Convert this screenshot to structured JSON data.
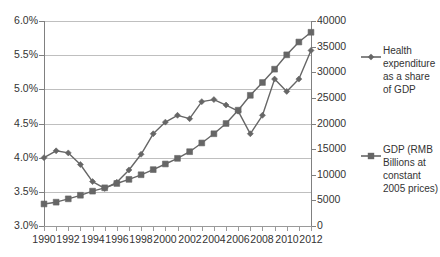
{
  "chart_data": {
    "type": "line",
    "title": "",
    "subtitle": "",
    "xlabel": "",
    "ylabel": "",
    "grid": true,
    "legend_position": "right",
    "x": [
      1990,
      1991,
      1992,
      1993,
      1994,
      1995,
      1996,
      1997,
      1998,
      1999,
      2000,
      2001,
      2002,
      2003,
      2004,
      2005,
      2006,
      2007,
      2008,
      2009,
      2010,
      2011,
      2012
    ],
    "x_tick_labels": [
      "1990",
      "1992",
      "1994",
      "1996",
      "1998",
      "2000",
      "2002",
      "2004",
      "2006",
      "2008",
      "2010",
      "2012"
    ],
    "axes": {
      "left": {
        "label": "",
        "ylim": [
          3.0,
          6.0
        ],
        "tick_labels": [
          "6.0%",
          "5.5%",
          "5.0%",
          "4.5%",
          "4.0%",
          "3.5%",
          "3.0%"
        ],
        "tick_values": [
          6.0,
          5.5,
          5.0,
          4.5,
          4.0,
          3.5,
          3.0
        ]
      },
      "right": {
        "label": "",
        "ylim": [
          0,
          40000
        ],
        "tick_labels": [
          "40000",
          "35000",
          "30000",
          "25000",
          "20000",
          "15000",
          "10000",
          "5000",
          "0"
        ],
        "tick_values": [
          40000,
          35000,
          30000,
          25000,
          20000,
          15000,
          10000,
          5000,
          0
        ]
      }
    },
    "series": [
      {
        "name": "Health expenditure as a share of GDP",
        "axis": "left",
        "marker": "diamond",
        "color": "#666666",
        "values": [
          4.0,
          4.1,
          4.07,
          3.9,
          3.65,
          3.55,
          3.64,
          3.82,
          4.05,
          4.35,
          4.52,
          4.62,
          4.57,
          4.82,
          4.85,
          4.77,
          4.68,
          4.35,
          4.62,
          5.15,
          4.97,
          5.15,
          5.57
        ]
      },
      {
        "name": "GDP  (RMB Billions at constant 2005 prices)",
        "axis": "right",
        "marker": "square",
        "color": "#666666",
        "values": [
          4300,
          4650,
          5300,
          6000,
          6800,
          7450,
          8300,
          9100,
          10000,
          11000,
          12100,
          13200,
          14500,
          16200,
          18000,
          20000,
          22600,
          25500,
          28000,
          30600,
          33400,
          35900,
          37800
        ]
      }
    ]
  },
  "legend": {
    "entries": [
      {
        "label": "Health expenditure as a share of GDP",
        "marker": "diamond-marker-icon",
        "color": "#666666"
      },
      {
        "label": "GDP  (RMB Billions at constant 2005 prices)",
        "marker": "square-marker-icon",
        "color": "#666666"
      }
    ]
  }
}
